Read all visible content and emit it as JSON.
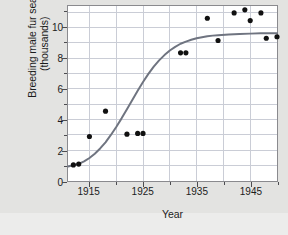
{
  "chart_data": {
    "type": "scatter",
    "title": "",
    "xlabel": "Year",
    "ylabel": "Breeding male fur seals (thousands)",
    "ylabel_line1": "Breeding male fur seals",
    "ylabel_line2": "(thousands)",
    "xlim": [
      1911,
      1950
    ],
    "ylim": [
      0,
      11.4
    ],
    "xticks": [
      1915,
      1925,
      1935,
      1945
    ],
    "xtick_labels": [
      "1915",
      "1925",
      "1935",
      "1945"
    ],
    "xminor_ticks": [
      1920,
      1930,
      1940,
      1950
    ],
    "yticks": [
      0,
      2,
      4,
      6,
      8,
      10
    ],
    "ytick_labels": [
      "0",
      "2",
      "4",
      "6",
      "8",
      "10"
    ],
    "yminor_ticks": [
      1,
      3,
      5,
      7,
      9,
      11
    ],
    "grid": true,
    "grid_color": "#c9ccd6",
    "point_color": "#111111",
    "curve_color": "#6f7480",
    "plot_bg": "#ffffff",
    "figure_bg": "#e3e3e1",
    "series": [
      {
        "name": "Breeding male fur seals",
        "marker": "circle",
        "points": [
          {
            "x": 1912,
            "y": 1.05
          },
          {
            "x": 1913,
            "y": 1.1
          },
          {
            "x": 1915,
            "y": 2.9
          },
          {
            "x": 1918,
            "y": 4.55
          },
          {
            "x": 1922,
            "y": 3.05
          },
          {
            "x": 1924,
            "y": 3.1
          },
          {
            "x": 1925,
            "y": 3.1
          },
          {
            "x": 1932,
            "y": 8.35
          },
          {
            "x": 1933,
            "y": 8.35
          },
          {
            "x": 1937,
            "y": 10.6
          },
          {
            "x": 1939,
            "y": 9.15
          },
          {
            "x": 1942,
            "y": 10.95
          },
          {
            "x": 1944,
            "y": 11.15
          },
          {
            "x": 1945,
            "y": 10.45
          },
          {
            "x": 1947,
            "y": 10.95
          },
          {
            "x": 1948,
            "y": 9.3
          },
          {
            "x": 1950,
            "y": 9.4
          }
        ]
      }
    ],
    "fit_curve": {
      "name": "logistic-fit",
      "color": "#6f7480",
      "points": [
        {
          "x": 1911.0,
          "y": 0.95
        },
        {
          "x": 1912.0,
          "y": 1.02
        },
        {
          "x": 1913.0,
          "y": 1.12
        },
        {
          "x": 1914.0,
          "y": 1.28
        },
        {
          "x": 1915.0,
          "y": 1.5
        },
        {
          "x": 1916.0,
          "y": 1.78
        },
        {
          "x": 1917.0,
          "y": 2.12
        },
        {
          "x": 1918.0,
          "y": 2.52
        },
        {
          "x": 1919.0,
          "y": 3.0
        },
        {
          "x": 1920.0,
          "y": 3.52
        },
        {
          "x": 1921.0,
          "y": 4.08
        },
        {
          "x": 1922.0,
          "y": 4.68
        },
        {
          "x": 1923.0,
          "y": 5.28
        },
        {
          "x": 1924.0,
          "y": 5.88
        },
        {
          "x": 1925.0,
          "y": 6.45
        },
        {
          "x": 1926.0,
          "y": 6.98
        },
        {
          "x": 1927.0,
          "y": 7.45
        },
        {
          "x": 1928.0,
          "y": 7.86
        },
        {
          "x": 1929.0,
          "y": 8.2
        },
        {
          "x": 1930.0,
          "y": 8.5
        },
        {
          "x": 1931.0,
          "y": 8.74
        },
        {
          "x": 1932.0,
          "y": 8.94
        },
        {
          "x": 1933.0,
          "y": 9.08
        },
        {
          "x": 1934.0,
          "y": 9.2
        },
        {
          "x": 1935.0,
          "y": 9.3
        },
        {
          "x": 1936.0,
          "y": 9.37
        },
        {
          "x": 1937.0,
          "y": 9.43
        },
        {
          "x": 1938.0,
          "y": 9.47
        },
        {
          "x": 1939.0,
          "y": 9.5
        },
        {
          "x": 1941.0,
          "y": 9.55
        },
        {
          "x": 1943.0,
          "y": 9.58
        },
        {
          "x": 1945.0,
          "y": 9.6
        },
        {
          "x": 1947.0,
          "y": 9.62
        },
        {
          "x": 1950.0,
          "y": 9.63
        }
      ]
    }
  }
}
